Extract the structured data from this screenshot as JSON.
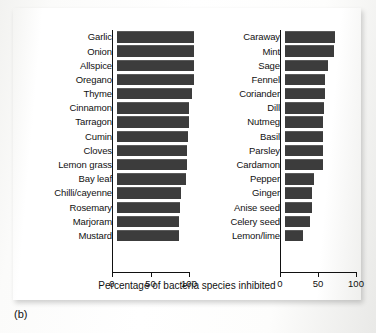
{
  "caption": "(b)",
  "chart_data": {
    "type": "bar",
    "title": "",
    "subtitle": "",
    "xlabel": "Percentage of bacteria species inhibited",
    "ylabel": "",
    "orientation": "horizontal",
    "xlim": [
      0,
      100
    ],
    "xticks": [
      0,
      50,
      100
    ],
    "xtick_labels": [
      "0",
      "50",
      "100"
    ],
    "grid": false,
    "legend": null,
    "bar_color": "#3c3c3c",
    "panels": [
      {
        "name": "left-panel",
        "categories": [
          "Garlic",
          "Onion",
          "Allspice",
          "Oregano",
          "Thyme",
          "Cinnamon",
          "Tarragon",
          "Cumin",
          "Cloves",
          "Lemon grass",
          "Bay leaf",
          "Chilli/cayenne",
          "Rosemary",
          "Marjoram",
          "Mustard"
        ],
        "values": [
          100,
          100,
          100,
          100,
          97,
          94,
          93,
          92,
          91,
          91,
          89,
          83,
          82,
          80,
          80
        ]
      },
      {
        "name": "right-panel",
        "categories": [
          "Caraway",
          "Mint",
          "Sage",
          "Fennel",
          "Coriander",
          "Dill",
          "Nutmeg",
          "Basil",
          "Parsley",
          "Cardamon",
          "Pepper",
          "Ginger",
          "Anise seed",
          "Celery seed",
          "Lemon/lime"
        ],
        "values": [
          66,
          64,
          56,
          53,
          52,
          51,
          50,
          50,
          50,
          50,
          38,
          36,
          36,
          33,
          24
        ]
      }
    ]
  }
}
